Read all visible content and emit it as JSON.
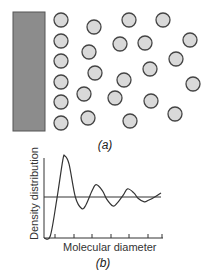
{
  "figure": {
    "panel_a": {
      "caption": "(a)",
      "wall": {
        "x": 13,
        "y": 12,
        "w": 32,
        "h": 119,
        "fill": "#8c8c8c",
        "stroke": "#555555"
      },
      "molecule_style": {
        "r": 7,
        "fill": "#d9d9d9",
        "stroke": "#444444"
      },
      "molecules": [
        {
          "x": 61,
          "y": 20
        },
        {
          "x": 61,
          "y": 41
        },
        {
          "x": 61,
          "y": 61
        },
        {
          "x": 61,
          "y": 82
        },
        {
          "x": 61,
          "y": 102
        },
        {
          "x": 61,
          "y": 123
        },
        {
          "x": 94,
          "y": 27
        },
        {
          "x": 89,
          "y": 52
        },
        {
          "x": 95,
          "y": 73
        },
        {
          "x": 84,
          "y": 94
        },
        {
          "x": 88,
          "y": 118
        },
        {
          "x": 129,
          "y": 20
        },
        {
          "x": 120,
          "y": 44
        },
        {
          "x": 124,
          "y": 80
        },
        {
          "x": 115,
          "y": 98
        },
        {
          "x": 130,
          "y": 121
        },
        {
          "x": 163,
          "y": 20
        },
        {
          "x": 145,
          "y": 43
        },
        {
          "x": 150,
          "y": 69
        },
        {
          "x": 151,
          "y": 101
        },
        {
          "x": 190,
          "y": 40
        },
        {
          "x": 176,
          "y": 59
        },
        {
          "x": 193,
          "y": 84
        },
        {
          "x": 175,
          "y": 114
        }
      ]
    },
    "panel_b": {
      "caption": "(b)",
      "ylabel": "Density distribution",
      "xlabel": "Molecular diameter"
    }
  },
  "chart_data": {
    "type": "line",
    "title": "",
    "xlabel": "Molecular diameter",
    "ylabel": "Density distribution",
    "grid": false,
    "x_ticks_count": 7,
    "baseline_y": 1.0,
    "x": [
      0,
      0.3,
      0.6,
      0.9,
      1.0,
      1.2,
      1.5,
      1.8,
      2.0,
      2.3,
      2.5,
      2.8,
      3.0,
      3.3,
      3.5,
      3.8,
      4.0,
      4.3,
      4.5,
      4.8,
      5.0,
      5.3,
      5.6
    ],
    "values": [
      0,
      0.05,
      0.9,
      1.9,
      2.0,
      1.8,
      1.0,
      0.72,
      0.8,
      1.15,
      1.3,
      1.15,
      0.95,
      0.78,
      0.85,
      1.05,
      1.2,
      1.1,
      0.97,
      0.88,
      0.92,
      1.0,
      1.1
    ],
    "legend": []
  }
}
